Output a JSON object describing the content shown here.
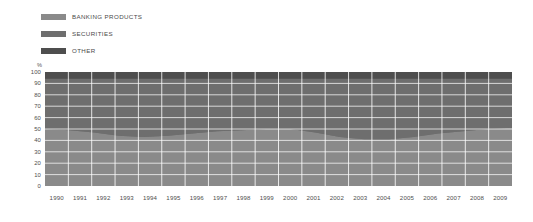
{
  "legend": {
    "items": [
      {
        "label": "BANKING PRODUCTS",
        "color": "#8a8a8a",
        "name": "banking-products"
      },
      {
        "label": "SECURITIES",
        "color": "#6e6e6e",
        "name": "securities"
      },
      {
        "label": "OTHER",
        "color": "#4e4e4e",
        "name": "other"
      }
    ]
  },
  "axes": {
    "y_unit": "%",
    "y_ticks": [
      "100",
      "90",
      "80",
      "70",
      "60",
      "50",
      "40",
      "30",
      "20",
      "10",
      "0"
    ],
    "x_ticks": [
      "1990",
      "1991",
      "1992",
      "1993",
      "1994",
      "1995",
      "1996",
      "1997",
      "1998",
      "1999",
      "2000",
      "2001",
      "2002",
      "2003",
      "2004",
      "2005",
      "2006",
      "2007",
      "2008",
      "2009"
    ]
  },
  "chart_data": {
    "type": "area",
    "title": "",
    "subtitle": "",
    "xlabel": "",
    "ylabel": "%",
    "ylim": [
      0,
      100
    ],
    "stacked": true,
    "normalized": true,
    "grid": true,
    "legend_position": "top-left",
    "x": [
      "1990",
      "1991",
      "1992",
      "1993",
      "1994",
      "1995",
      "1996",
      "1997",
      "1998",
      "1999",
      "2000",
      "2001",
      "2002",
      "2003",
      "2004",
      "2005",
      "2006",
      "2007",
      "2008",
      "2009"
    ],
    "series": [
      {
        "name": "BANKING PRODUCTS",
        "color": "#8a8a8a",
        "values": [
          50,
          49,
          47,
          44,
          43,
          44,
          46,
          48,
          49,
          50,
          50,
          47,
          43,
          41,
          41,
          43,
          46,
          48,
          50,
          51
        ]
      },
      {
        "name": "SECURITIES",
        "color": "#6e6e6e",
        "values": [
          44,
          45,
          47,
          50,
          51,
          50,
          48,
          46,
          45,
          44,
          44,
          47,
          51,
          53,
          53,
          51,
          48,
          46,
          44,
          43
        ]
      },
      {
        "name": "OTHER",
        "color": "#4e4e4e",
        "values": [
          6,
          6,
          6,
          6,
          6,
          6,
          6,
          6,
          6,
          6,
          6,
          6,
          6,
          6,
          6,
          6,
          6,
          6,
          6,
          6
        ]
      }
    ]
  }
}
